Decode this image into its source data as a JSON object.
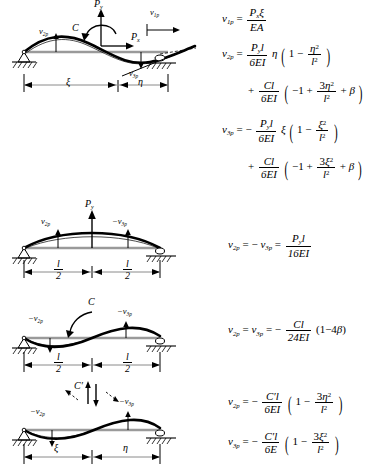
{
  "figure": {
    "cases": [
      {
        "id": "case-1",
        "name": "axial-and-transverse-load-with-couple",
        "loads": [
          "P_x",
          "P_y",
          "C"
        ],
        "deflection_labels": [
          "v_2p",
          "v_3p",
          "v_1p"
        ],
        "dimensions": [
          "ξ",
          "η"
        ],
        "supports": [
          "pin",
          "roller"
        ]
      },
      {
        "id": "case-2",
        "name": "midspan-transverse-load",
        "loads": [
          "P_y"
        ],
        "deflection_labels": [
          "v_2p",
          "-v_3p"
        ],
        "dimensions": [
          "l/2",
          "l/2"
        ],
        "supports": [
          "pin",
          "roller"
        ]
      },
      {
        "id": "case-3",
        "name": "midspan-couple",
        "loads": [
          "C"
        ],
        "deflection_labels": [
          "-v_2p",
          "-v_3p"
        ],
        "dimensions": [
          "l/2",
          "l/2"
        ],
        "supports": [
          "pin",
          "roller"
        ]
      },
      {
        "id": "case-4",
        "name": "couple-at-arbitrary-location",
        "loads": [
          "C'"
        ],
        "deflection_labels": [
          "-v_2p",
          "-v_3p"
        ],
        "dimensions": [
          "ξ",
          "η"
        ],
        "supports": [
          "pin",
          "roller"
        ]
      }
    ],
    "symbols": {
      "Px": "P",
      "Px_sub": "x",
      "Py": "P",
      "Py_sub": "y",
      "C": "C",
      "Cprime": "C′",
      "xi": "ξ",
      "eta": "η",
      "beta": "β",
      "l": "l",
      "v": "v",
      "E": "E",
      "A": "A",
      "I": "I"
    },
    "labels": {
      "v1p": "v",
      "v1p_sub": "1p",
      "v2p": "v",
      "v2p_sub": "2p",
      "v3p": "v",
      "v3p_sub": "3p",
      "neg_v2p": "−v",
      "neg_v3p": "−v",
      "half_l_num": "l",
      "half_l_den": "2"
    }
  },
  "equations": {
    "group1": {
      "eq1": {
        "lhs_v": "v",
        "lhs_sub": "1p",
        "eq": "=",
        "num": "P",
        "num_sub": "x",
        "num_sym": "ξ",
        "den": "EA"
      },
      "eq2_line1": {
        "lhs_v": "v",
        "lhs_sub": "2p",
        "eq": "=",
        "num": "P",
        "num_sub": "y",
        "num_l": "l",
        "den": "6EI",
        "factor": "η",
        "paren_open": "(",
        "one": "1",
        "minus": "−",
        "frac_num": "η",
        "frac_num_sup": "2",
        "frac_den": "l",
        "frac_den_sup": "2",
        "paren_close": ")"
      },
      "eq2_line2": {
        "plus": "+",
        "num": "Cl",
        "den": "6EI",
        "paren_open": "(",
        "neg_one": "−1",
        "plus2": "+",
        "frac_num_coef": "3",
        "frac_num": "η",
        "frac_num_sup": "2",
        "frac_den": "l",
        "frac_den_sup": "2",
        "plus3": "+",
        "beta": "β",
        "paren_close": ")"
      },
      "eq3_line1": {
        "lhs_v": "v",
        "lhs_sub": "3p",
        "eq": "=",
        "sign": "−",
        "num": "P",
        "num_sub": "y",
        "num_l": "l",
        "den": "6EI",
        "factor": "ξ",
        "paren_open": "(",
        "one": "1",
        "minus": "−",
        "frac_num": "ξ",
        "frac_num_sup": "2",
        "frac_den": "l",
        "frac_den_sup": "2",
        "paren_close": ")"
      },
      "eq3_line2": {
        "plus": "+",
        "num": "Cl",
        "den": "6EI",
        "paren_open": "(",
        "neg_one": "−1",
        "plus2": "+",
        "frac_num_coef": "3",
        "frac_num": "ξ",
        "frac_num_sup": "2",
        "frac_den": "l",
        "frac_den_sup": "2",
        "plus3": "+",
        "beta": "β",
        "paren_close": ")"
      }
    },
    "group2": {
      "eq1": {
        "lhs_v": "v",
        "lhs_sub": "2p",
        "eq": "=",
        "minus": "−",
        "rhs_v": "v",
        "rhs_sub": "3p",
        "eq2": "=",
        "num": "P",
        "num_sub": "y",
        "num_l": "l",
        "den": "16EI"
      }
    },
    "group3": {
      "eq1": {
        "lhs_v": "v",
        "lhs_sub": "2p",
        "eq": "=",
        "rhs_v": "v",
        "rhs_sub": "3p",
        "eq2": "=",
        "sign": "−",
        "num": "Cl",
        "den": "24EI",
        "tail_open": "(",
        "tail_one": "1",
        "tail_minus": "−",
        "tail_four": "4",
        "tail_beta": "β",
        "tail_close": ")"
      }
    },
    "group4": {
      "eq1": {
        "lhs_v": "v",
        "lhs_sub": "2p",
        "eq": "=",
        "sign": "−",
        "num": "C′l",
        "den": "6EI",
        "paren_open": "(",
        "one": "1",
        "minus": "−",
        "frac_num_coef": "3",
        "frac_num": "η",
        "frac_num_sup": "2",
        "frac_den": "l",
        "frac_den_sup": "2",
        "paren_close": ")"
      },
      "eq2": {
        "lhs_v": "v",
        "lhs_sub": "3p",
        "eq": "=",
        "sign": "−",
        "num": "C′l",
        "den": "6E",
        "paren_open": "(",
        "one": "1",
        "minus": "−",
        "frac_num_coef": "3",
        "frac_num": "ξ",
        "frac_num_sup": "2",
        "frac_den": "l",
        "frac_den_sup": "2",
        "paren_close": ")"
      }
    }
  },
  "colors": {
    "ink": "#000000",
    "beam_gray": "#9a9a9a",
    "dim_gray": "#8a8a8a",
    "page": "#ffffff"
  }
}
